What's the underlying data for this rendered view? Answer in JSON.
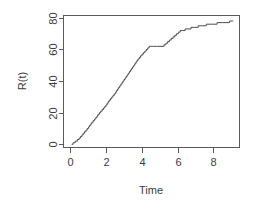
{
  "chart_data": {
    "type": "line",
    "title": "",
    "subtitle": "",
    "xlabel": "Time",
    "ylabel": "R(t)",
    "xlim": [
      -0.35,
      9.45
    ],
    "ylim": [
      -2.0,
      81.5
    ],
    "xticks": [
      0,
      2,
      4,
      6,
      8
    ],
    "xtick_labels": [
      "0",
      "2",
      "4",
      "6",
      "8"
    ],
    "yticks": [
      0,
      20,
      40,
      60,
      80
    ],
    "ytick_labels": [
      "0",
      "20",
      "40",
      "60",
      "80"
    ],
    "grid": false,
    "legend": null,
    "legend_position": "none",
    "box": "full-rectangle",
    "line_color": "#4a4a4a",
    "axis_color": "#5a5a5a",
    "background_color": "#ffffff",
    "ylabel_rotation": 90,
    "ytick_label_rotation": 90,
    "step_type": "staircase-counting-process",
    "series": [
      {
        "name": "R(t)",
        "color": "#4a4a4a",
        "x": [
          0.1,
          0.18,
          0.3,
          0.42,
          0.52,
          0.6,
          0.68,
          0.75,
          0.82,
          0.9,
          0.97,
          1.04,
          1.1,
          1.17,
          1.23,
          1.3,
          1.38,
          1.45,
          1.52,
          1.58,
          1.65,
          1.72,
          1.8,
          1.88,
          1.95,
          2.02,
          2.08,
          2.14,
          2.2,
          2.27,
          2.34,
          2.41,
          2.48,
          2.55,
          2.6,
          2.66,
          2.72,
          2.78,
          2.84,
          2.9,
          2.96,
          3.02,
          3.08,
          3.14,
          3.2,
          3.26,
          3.32,
          3.38,
          3.44,
          3.5,
          3.56,
          3.62,
          3.68,
          3.74,
          3.8,
          3.87,
          3.94,
          4.02,
          4.1,
          4.18,
          4.26,
          4.34,
          4.42,
          4.5,
          4.58,
          4.66,
          4.74,
          4.82,
          4.9,
          5.25,
          5.35,
          5.45,
          5.55,
          5.65,
          5.75,
          5.85,
          5.95,
          6.05,
          6.15,
          6.28,
          6.42,
          6.58,
          6.75,
          6.95,
          7.15,
          7.35,
          7.6,
          7.9,
          8.2,
          8.5,
          8.7,
          8.9,
          9.05,
          9.1
        ],
        "y": [
          0,
          1,
          2,
          3,
          4,
          5,
          6,
          7,
          8,
          9,
          10,
          11,
          12,
          13,
          14,
          15,
          16,
          17,
          18,
          19,
          20,
          21,
          22,
          23,
          24,
          25,
          26,
          27,
          28,
          29,
          30,
          31,
          32,
          33,
          34,
          35,
          36,
          37,
          38,
          39,
          40,
          41,
          42,
          43,
          44,
          45,
          46,
          47,
          48,
          49,
          50,
          51,
          52,
          53,
          54,
          55,
          56,
          57,
          58,
          59,
          60,
          61,
          62,
          62,
          62,
          62,
          62,
          62,
          62,
          63,
          64,
          65,
          66,
          67,
          68,
          69,
          70,
          71,
          72,
          72,
          73,
          73,
          74,
          74,
          75,
          75,
          76,
          76,
          77,
          77,
          77,
          78,
          78,
          78
        ]
      }
    ]
  }
}
